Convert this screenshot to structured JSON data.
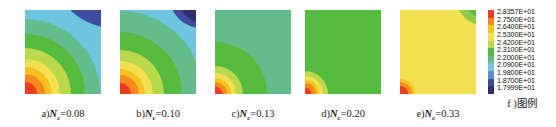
{
  "figure": {
    "type": "contour-panel-series",
    "panel_count": 5
  },
  "panels": [
    {
      "id": "a",
      "caption_prefix": "a)",
      "variable": "N",
      "subscript": "c",
      "equals": "=",
      "value": "0.08",
      "base_color": "#6ec5e0",
      "features": "dark-navy lobe upper-right, light-blue band, green mid-field, concentric orange-red bands at lower-left corner"
    },
    {
      "id": "b",
      "caption_prefix": "b)",
      "variable": "N",
      "subscript": "c",
      "equals": "=",
      "value": "0.10",
      "base_color": "#6ec5e0",
      "features": "dark-navy circular lobe upper-right, broad light-blue field, green bands, orange-red corner at lower-left"
    },
    {
      "id": "c",
      "caption_prefix": "c)",
      "variable": "N",
      "subscript": "c",
      "equals": "=",
      "value": "0.13",
      "base_color": "#63bd8a",
      "features": "mostly mid-green field with small orange-red concentric corner at lower-left"
    },
    {
      "id": "d",
      "caption_prefix": "d)",
      "variable": "N",
      "subscript": "c",
      "equals": "=",
      "value": "0.20",
      "base_color": "#55bb3f",
      "features": "near-uniform green field with small orange-red concentric corner at lower-left"
    },
    {
      "id": "e",
      "caption_prefix": "e)",
      "variable": "N",
      "subscript": "c",
      "equals": "=",
      "value": "0.33",
      "base_color": "#f2e050",
      "features": "mostly yellow field, green lobe upper-right, small orange-red corner at lower-left"
    }
  ],
  "legend": {
    "caption_prefix": "f )",
    "caption_text": "图例",
    "ticks": [
      {
        "value": "2.8357E+01",
        "color": "#ef3b22"
      },
      {
        "value": "2.7500E+01",
        "color": "#f58a1f"
      },
      {
        "value": "2.6400E+01",
        "color": "#f5c21f"
      },
      {
        "value": "2.5300E+01",
        "color": "#f2e050"
      },
      {
        "value": "2.4200E+01",
        "color": "#b9d94a"
      },
      {
        "value": "2.3100E+01",
        "color": "#55bb3f"
      },
      {
        "value": "2.2000E+01",
        "color": "#63bd8a"
      },
      {
        "value": "2.0900E+01",
        "color": "#6ec5e0"
      },
      {
        "value": "1.9800E+01",
        "color": "#5a8fd0"
      },
      {
        "value": "1.8700E+01",
        "color": "#3f4b9e"
      },
      {
        "value": "1.7999E+01",
        "color": "#2e2f6b"
      }
    ]
  },
  "chart_data": {
    "type": "heatmap",
    "title": "",
    "xlabel": "",
    "ylabel": "",
    "legend_position": "right",
    "grid": false,
    "colorbar": {
      "label": "图例",
      "min": 17.999,
      "max": 28.357,
      "tick_values": [
        28.357,
        27.5,
        26.4,
        25.3,
        24.2,
        23.1,
        22.0,
        20.9,
        19.8,
        18.7,
        17.999
      ],
      "tick_labels": [
        "2.8357E+01",
        "2.7500E+01",
        "2.6400E+01",
        "2.5300E+01",
        "2.4200E+01",
        "2.3100E+01",
        "2.2000E+01",
        "2.0900E+01",
        "1.9800E+01",
        "1.8700E+01",
        "1.7999E+01"
      ],
      "colors": [
        "#ef3b22",
        "#f58a1f",
        "#f5c21f",
        "#f2e050",
        "#b9d94a",
        "#55bb3f",
        "#63bd8a",
        "#6ec5e0",
        "#5a8fd0",
        "#3f4b9e",
        "#2e2f6b"
      ]
    },
    "series": [
      {
        "name": "a) Nc=0.08",
        "parameter": 0.08,
        "field_min": 17.999,
        "field_max": 28.357
      },
      {
        "name": "b) Nc=0.10",
        "parameter": 0.1,
        "field_min": 17.999,
        "field_max": 28.357
      },
      {
        "name": "c) Nc=0.13",
        "parameter": 0.13,
        "field_min": 17.999,
        "field_max": 28.357
      },
      {
        "name": "d) Nc=0.20",
        "parameter": 0.2,
        "field_min": 17.999,
        "field_max": 28.357
      },
      {
        "name": "e) Nc=0.33",
        "parameter": 0.33,
        "field_min": 17.999,
        "field_max": 28.357
      }
    ],
    "categories": [
      "a",
      "b",
      "c",
      "d",
      "e"
    ]
  }
}
